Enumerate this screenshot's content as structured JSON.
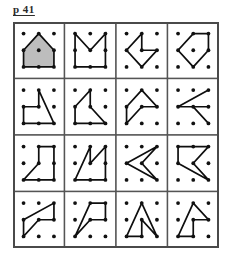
{
  "page": {
    "label": "p 41",
    "background_color": "#ffffff",
    "ink_color": "#111111",
    "shade_color": "#bdbdbd",
    "frame_color": "#555555"
  },
  "geoboard": {
    "rows": 4,
    "columns": 4,
    "pegs_per_cell": 9,
    "peg_rows": 3,
    "peg_columns": 3,
    "cell_count": 16,
    "cells": [
      {
        "index": 1,
        "row": 1,
        "column": 1,
        "name": "house-pentagon-shaded",
        "shaded": true,
        "closed": true,
        "vertices": [
          [
            0,
            1
          ],
          [
            1,
            0
          ],
          [
            2,
            1
          ],
          [
            2,
            2
          ],
          [
            0,
            2
          ]
        ]
      },
      {
        "index": 2,
        "row": 1,
        "column": 2,
        "name": "m-zigzag-open-box",
        "shaded": false,
        "closed": false,
        "vertices": [
          [
            0,
            2
          ],
          [
            0,
            0
          ],
          [
            1,
            1
          ],
          [
            2,
            0
          ],
          [
            2,
            2
          ],
          [
            0,
            2
          ]
        ]
      },
      {
        "index": 3,
        "row": 1,
        "column": 3,
        "name": "arrow-left-notch",
        "shaded": false,
        "closed": true,
        "vertices": [
          [
            1,
            0
          ],
          [
            0,
            1
          ],
          [
            1,
            2
          ],
          [
            2,
            1
          ],
          [
            1,
            1
          ]
        ]
      },
      {
        "index": 4,
        "row": 1,
        "column": 4,
        "name": "pentagon-tilted",
        "shaded": false,
        "closed": true,
        "vertices": [
          [
            1,
            0
          ],
          [
            2,
            0
          ],
          [
            2,
            1
          ],
          [
            1,
            2
          ],
          [
            0,
            1
          ]
        ]
      },
      {
        "index": 5,
        "row": 2,
        "column": 1,
        "name": "flag-triangle-step",
        "shaded": false,
        "closed": true,
        "vertices": [
          [
            1,
            0
          ],
          [
            2,
            2
          ],
          [
            0,
            2
          ],
          [
            0,
            1
          ],
          [
            1,
            1
          ]
        ]
      },
      {
        "index": 6,
        "row": 2,
        "column": 2,
        "name": "sail-quadrilateral",
        "shaded": false,
        "closed": true,
        "vertices": [
          [
            1,
            0
          ],
          [
            1,
            1
          ],
          [
            2,
            2
          ],
          [
            0,
            2
          ],
          [
            0,
            1
          ]
        ]
      },
      {
        "index": 7,
        "row": 2,
        "column": 3,
        "name": "peak-with-tail",
        "shaded": false,
        "closed": true,
        "vertices": [
          [
            1,
            0
          ],
          [
            2,
            1
          ],
          [
            1,
            1
          ],
          [
            0,
            2
          ],
          [
            0,
            1
          ]
        ]
      },
      {
        "index": 8,
        "row": 2,
        "column": 4,
        "name": "lightning-zigzag",
        "shaded": false,
        "closed": false,
        "vertices": [
          [
            2,
            0
          ],
          [
            0,
            1
          ],
          [
            2,
            1
          ],
          [
            1,
            1
          ],
          [
            2,
            2
          ]
        ]
      },
      {
        "index": 9,
        "row": 3,
        "column": 1,
        "name": "chair-step-shape",
        "shaded": false,
        "closed": true,
        "vertices": [
          [
            1,
            0
          ],
          [
            2,
            0
          ],
          [
            2,
            2
          ],
          [
            0,
            2
          ],
          [
            1,
            1
          ]
        ]
      },
      {
        "index": 10,
        "row": 3,
        "column": 2,
        "name": "m-stroke-open",
        "shaded": false,
        "closed": true,
        "vertices": [
          [
            1,
            0
          ],
          [
            1,
            1
          ],
          [
            2,
            0
          ],
          [
            2,
            2
          ],
          [
            0,
            2
          ]
        ]
      },
      {
        "index": 11,
        "row": 3,
        "column": 3,
        "name": "double-chevron-left",
        "shaded": false,
        "closed": false,
        "vertices": [
          [
            2,
            0
          ],
          [
            0,
            1
          ],
          [
            2,
            2
          ],
          [
            1,
            1
          ],
          [
            2,
            0
          ]
        ]
      },
      {
        "index": 12,
        "row": 3,
        "column": 4,
        "name": "bracket-chevron",
        "shaded": false,
        "closed": false,
        "vertices": [
          [
            2,
            0
          ],
          [
            0,
            0
          ],
          [
            0,
            1
          ],
          [
            2,
            2
          ],
          [
            1,
            1
          ],
          [
            2,
            0
          ]
        ]
      },
      {
        "index": 13,
        "row": 4,
        "column": 1,
        "name": "narrow-wedge",
        "shaded": false,
        "closed": true,
        "vertices": [
          [
            2,
            0
          ],
          [
            2,
            1
          ],
          [
            1,
            1
          ],
          [
            0,
            2
          ],
          [
            0,
            1
          ]
        ]
      },
      {
        "index": 14,
        "row": 4,
        "column": 2,
        "name": "slanted-flag",
        "shaded": false,
        "closed": true,
        "vertices": [
          [
            1,
            0
          ],
          [
            2,
            0
          ],
          [
            2,
            1
          ],
          [
            1,
            1
          ],
          [
            0,
            2
          ]
        ]
      },
      {
        "index": 15,
        "row": 4,
        "column": 3,
        "name": "a-frame-triangle",
        "shaded": false,
        "closed": true,
        "vertices": [
          [
            1,
            0
          ],
          [
            2,
            2
          ],
          [
            1,
            1
          ],
          [
            1,
            2
          ],
          [
            0,
            2
          ]
        ]
      },
      {
        "index": 16,
        "row": 4,
        "column": 4,
        "name": "a-frame-with-shelf",
        "shaded": false,
        "closed": true,
        "vertices": [
          [
            1,
            0
          ],
          [
            2,
            1
          ],
          [
            1,
            1
          ],
          [
            1,
            2
          ],
          [
            0,
            2
          ]
        ]
      }
    ]
  }
}
